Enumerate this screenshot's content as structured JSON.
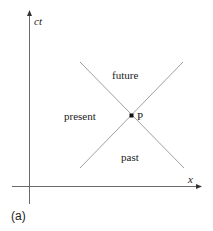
{
  "diagram": {
    "type": "spacetime-light-cone",
    "axes": {
      "vertical_label": "ct",
      "horizontal_label": "x"
    },
    "regions": {
      "future": "future",
      "past": "past",
      "present": "present"
    },
    "event_label": "P",
    "panel_label": "(a)",
    "colors": {
      "axis": "#555555",
      "cone_lines": "#9a9a9a",
      "event_point": "#111111",
      "text": "#222222"
    }
  }
}
